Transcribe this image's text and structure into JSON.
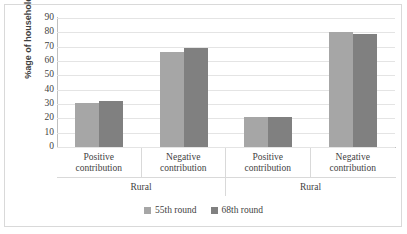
{
  "chart_data": {
    "type": "bar",
    "title": "",
    "xlabel": "",
    "ylabel": "%age of households",
    "ylim": [
      0,
      90
    ],
    "ytick_step": 10,
    "yticks": [
      90,
      80,
      70,
      60,
      50,
      40,
      30,
      20,
      10,
      0
    ],
    "grid": true,
    "legend_position": "bottom",
    "categories": [
      "Positive contribution",
      "Negative contribution",
      "Positive contribution",
      "Negative contribution"
    ],
    "category_lines": [
      [
        "Positive",
        "contribution"
      ],
      [
        "Negative",
        "contribution"
      ],
      [
        "Positive",
        "contribution"
      ],
      [
        "Negative",
        "contribution"
      ]
    ],
    "groups": [
      {
        "label": "Rural",
        "span": 2
      },
      {
        "label": "Rural",
        "span": 2
      }
    ],
    "series": [
      {
        "name": "55th round",
        "color": "#a6a6a6",
        "values": [
          31,
          66,
          21,
          80
        ]
      },
      {
        "name": "68th round",
        "color": "#808080",
        "values": [
          32,
          69,
          21,
          79
        ]
      }
    ]
  },
  "colors": {
    "series_55th": "#a6a6a6",
    "series_68th": "#808080",
    "gridline": "#e4e4e4",
    "axis": "#bfbfbf",
    "border": "#d9d9d9",
    "text": "#3f3f3f"
  }
}
